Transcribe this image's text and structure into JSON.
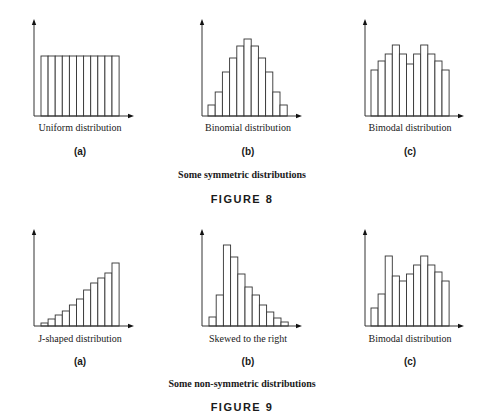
{
  "figure8": {
    "caption": "Some symmetric distributions",
    "title": "FIGURE 8",
    "panels": [
      {
        "letter": "(a)",
        "label": "Uniform distribution"
      },
      {
        "letter": "(b)",
        "label": "Binomial distribution"
      },
      {
        "letter": "(c)",
        "label": "Bimodal distribution"
      }
    ]
  },
  "figure9": {
    "caption": "Some non-symmetric distributions",
    "title": "FIGURE 9",
    "panels": [
      {
        "letter": "(a)",
        "label": "J-shaped distribution"
      },
      {
        "letter": "(b)",
        "label": "Skewed to the right"
      },
      {
        "letter": "(c)",
        "label": "Bimodal distribution"
      }
    ]
  },
  "chart_data": [
    {
      "type": "bar",
      "title": "Uniform distribution",
      "panel": "(a)",
      "figure": "FIGURE 8",
      "categories": [
        1,
        2,
        3,
        4,
        5,
        6,
        7,
        8,
        9,
        10,
        11
      ],
      "values": [
        60,
        60,
        60,
        60,
        60,
        60,
        60,
        60,
        60,
        60,
        60
      ],
      "xlabel": "",
      "ylabel": "",
      "grid": false
    },
    {
      "type": "bar",
      "title": "Binomial distribution",
      "panel": "(b)",
      "figure": "FIGURE 8",
      "categories": [
        1,
        2,
        3,
        4,
        5,
        6,
        7,
        8,
        9,
        10,
        11
      ],
      "values": [
        11,
        24,
        44,
        58,
        70,
        77,
        70,
        58,
        44,
        24,
        11
      ],
      "xlabel": "",
      "ylabel": "",
      "grid": false
    },
    {
      "type": "bar",
      "title": "Bimodal distribution",
      "panel": "(c)",
      "figure": "FIGURE 8",
      "categories": [
        1,
        2,
        3,
        4,
        5,
        6,
        7,
        8,
        9,
        10,
        11
      ],
      "values": [
        46,
        55,
        62,
        71,
        62,
        52,
        62,
        71,
        62,
        55,
        46
      ],
      "xlabel": "",
      "ylabel": "",
      "grid": false
    },
    {
      "type": "bar",
      "title": "J-shaped distribution",
      "panel": "(a)",
      "figure": "FIGURE 9",
      "categories": [
        1,
        2,
        3,
        4,
        5,
        6,
        7,
        8,
        9,
        10,
        11
      ],
      "values": [
        3,
        7,
        11,
        15,
        21,
        27,
        36,
        43,
        48,
        53,
        63
      ],
      "xlabel": "",
      "ylabel": "",
      "grid": false
    },
    {
      "type": "bar",
      "title": "Skewed to the right",
      "panel": "(b)",
      "figure": "FIGURE 9",
      "categories": [
        1,
        2,
        3,
        4,
        5,
        6,
        7,
        8,
        9,
        10,
        11
      ],
      "values": [
        9,
        31,
        81,
        69,
        52,
        39,
        31,
        21,
        14,
        8,
        4
      ],
      "xlabel": "",
      "ylabel": "",
      "grid": false
    },
    {
      "type": "bar",
      "title": "Bimodal distribution",
      "panel": "(c)",
      "figure": "FIGURE 9",
      "categories": [
        1,
        2,
        3,
        4,
        5,
        6,
        7,
        8,
        9,
        10,
        11
      ],
      "values": [
        18,
        32,
        70,
        50,
        45,
        52,
        61,
        70,
        61,
        54,
        45
      ],
      "xlabel": "",
      "ylabel": "",
      "grid": false
    }
  ]
}
